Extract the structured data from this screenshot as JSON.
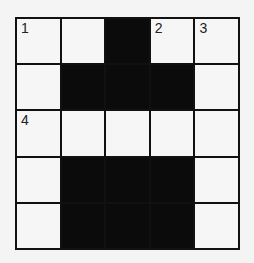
{
  "puzzle": {
    "rows": 5,
    "cols": 5,
    "grid": [
      [
        "W",
        "W",
        "B",
        "W",
        "W"
      ],
      [
        "W",
        "B",
        "B",
        "B",
        "W"
      ],
      [
        "W",
        "W",
        "W",
        "W",
        "W"
      ],
      [
        "W",
        "B",
        "B",
        "B",
        "W"
      ],
      [
        "W",
        "B",
        "B",
        "B",
        "W"
      ]
    ],
    "numbers": {
      "0-0": "1",
      "0-3": "2",
      "0-4": "3",
      "2-0": "4"
    }
  },
  "colors": {
    "block": "#0b0b0b",
    "cell": "#f4f4f4",
    "line": "#111111"
  }
}
